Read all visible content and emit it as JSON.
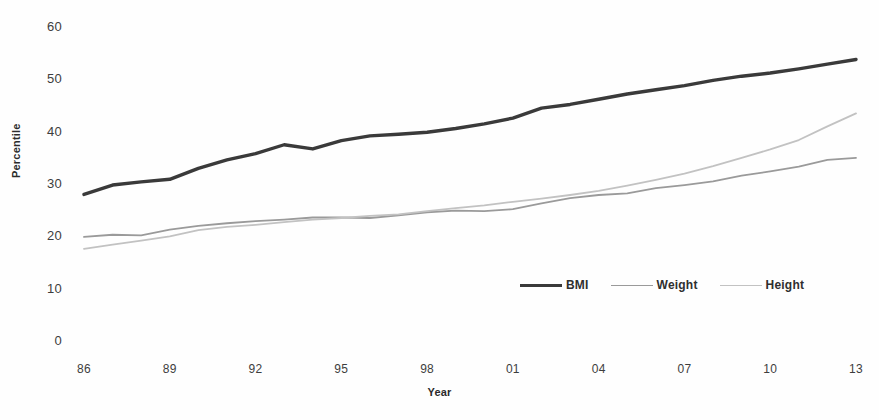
{
  "chart_data": {
    "type": "line",
    "title": "",
    "xlabel": "Year",
    "ylabel": "Percentile",
    "grid": false,
    "legend_position": "inside-lower-right",
    "xlim": [
      1986,
      2013
    ],
    "ylim": [
      0,
      60
    ],
    "yticks": [
      0,
      10,
      20,
      30,
      40,
      50,
      60
    ],
    "ytick_labels": [
      "0",
      "10",
      "20",
      "30",
      "40",
      "50",
      "60"
    ],
    "xticks": [
      1986,
      1989,
      1992,
      1995,
      1998,
      2001,
      2004,
      2007,
      2010,
      2013
    ],
    "xtick_labels": [
      "86",
      "89",
      "92",
      "95",
      "98",
      "01",
      "04",
      "07",
      "10",
      "13"
    ],
    "x": [
      1986,
      1987,
      1988,
      1989,
      1990,
      1991,
      1992,
      1993,
      1994,
      1995,
      1996,
      1997,
      1998,
      1999,
      2000,
      2001,
      2002,
      2003,
      2004,
      2005,
      2006,
      2007,
      2008,
      2009,
      2010,
      2011,
      2012,
      2013
    ],
    "series": [
      {
        "name": "BMI",
        "color": "#3a3a3a",
        "width": 3.4,
        "values": [
          28.0,
          29.8,
          30.4,
          30.9,
          33.0,
          34.6,
          35.8,
          37.5,
          36.7,
          38.3,
          39.2,
          39.5,
          39.9,
          40.6,
          41.5,
          42.6,
          44.5,
          45.2,
          46.2,
          47.2,
          48.0,
          48.8,
          49.8,
          50.6,
          51.2,
          52.0,
          52.9,
          53.8
        ]
      },
      {
        "name": "Weight",
        "color": "#9a9a9a",
        "width": 1.8,
        "values": [
          19.9,
          20.3,
          20.2,
          21.3,
          22.0,
          22.5,
          22.9,
          23.2,
          23.6,
          23.6,
          23.5,
          24.0,
          24.6,
          24.9,
          24.8,
          25.2,
          26.3,
          27.3,
          27.9,
          28.2,
          29.2,
          29.8,
          30.5,
          31.6,
          32.4,
          33.3,
          34.6,
          35.0
        ]
      },
      {
        "name": "Height",
        "color": "#c2c2c2",
        "width": 1.8,
        "values": [
          17.6,
          18.4,
          19.2,
          20.0,
          21.2,
          21.8,
          22.2,
          22.7,
          23.2,
          23.5,
          23.9,
          24.2,
          24.8,
          25.4,
          25.9,
          26.6,
          27.2,
          27.9,
          28.7,
          29.7,
          30.8,
          32.0,
          33.4,
          35.0,
          36.6,
          38.4,
          41.0,
          43.5
        ]
      }
    ],
    "annotations": []
  },
  "legend": {
    "items": [
      {
        "label": "BMI",
        "color": "#3a3a3a",
        "width": "3.4px"
      },
      {
        "label": "Weight",
        "color": "#9a9a9a",
        "width": "1.8px"
      },
      {
        "label": "Height",
        "color": "#c2c2c2",
        "width": "1.8px"
      }
    ]
  },
  "caption": {
    "text": ""
  }
}
